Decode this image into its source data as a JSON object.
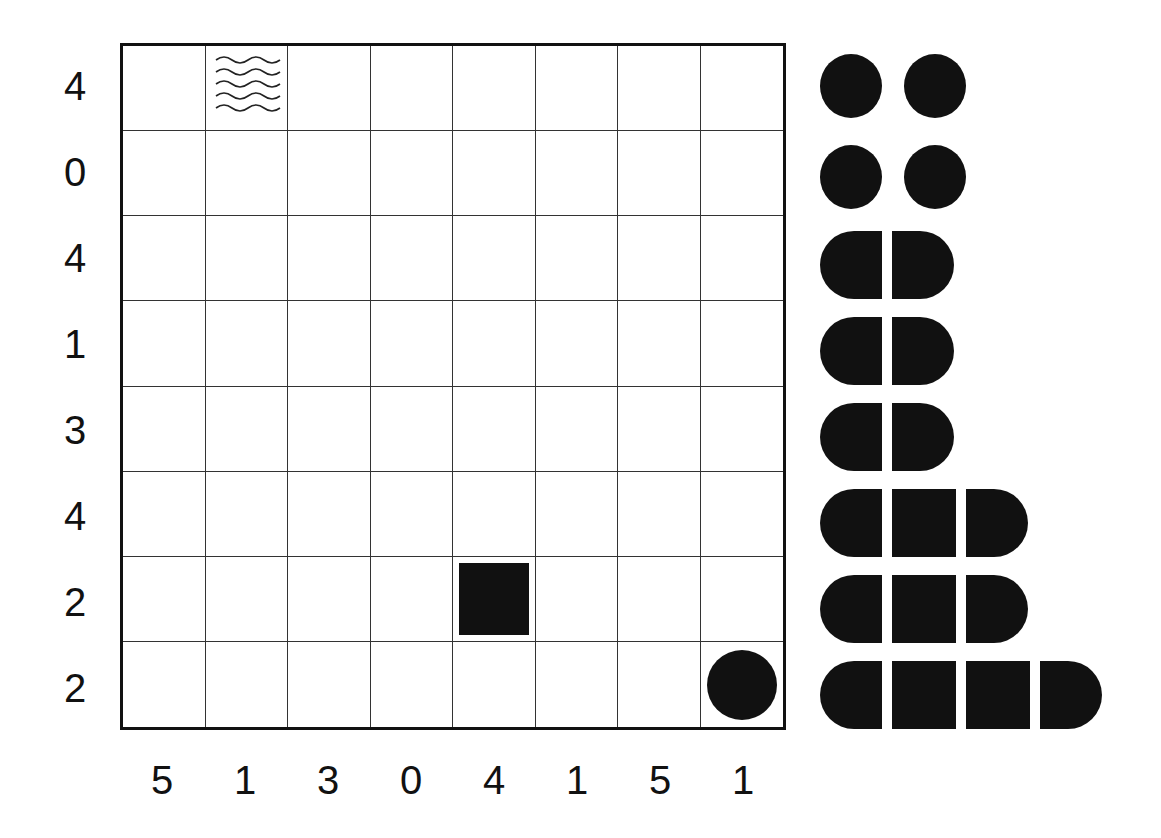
{
  "puzzle": {
    "type": "battleship",
    "size": 8,
    "row_clues": [
      "4",
      "0",
      "4",
      "1",
      "3",
      "4",
      "2",
      "2"
    ],
    "col_clues": [
      "5",
      "1",
      "3",
      "0",
      "4",
      "1",
      "5",
      "1"
    ],
    "given_cells": [
      {
        "row": 0,
        "col": 1,
        "content": "water"
      },
      {
        "row": 6,
        "col": 4,
        "content": "ship-middle"
      },
      {
        "row": 7,
        "col": 7,
        "content": "submarine"
      }
    ]
  },
  "fleet": [
    {
      "length": 1,
      "count": 2
    },
    {
      "length": 1,
      "count": 2
    },
    {
      "length": 2,
      "count": 1
    },
    {
      "length": 2,
      "count": 1
    },
    {
      "length": 2,
      "count": 1
    },
    {
      "length": 3,
      "count": 1
    },
    {
      "length": 3,
      "count": 1
    },
    {
      "length": 4,
      "count": 1
    }
  ],
  "colors": {
    "ink": "#111111",
    "background": "#ffffff"
  }
}
